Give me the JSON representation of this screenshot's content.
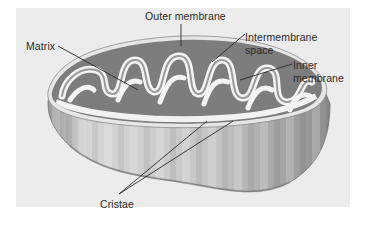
{
  "figure": {
    "labels": {
      "outer_membrane": "Outer membrane",
      "matrix": "Matrix",
      "intermembrane_space_line1": "Intermembrane",
      "intermembrane_space_line2": "space",
      "inner_membrane_line1": "Inner",
      "inner_membrane_line2": "membrane",
      "cristae": "Cristae"
    },
    "colors": {
      "background": "#ffffff",
      "panel": "#ececec",
      "body_light": "#d9d9d9",
      "body_dark": "#8c8c8c",
      "intermembrane": "#5e5e5e",
      "matrix": "#7a7a7a",
      "membrane": "#f2f2f2",
      "leader_line": "#2a2a2a"
    }
  }
}
